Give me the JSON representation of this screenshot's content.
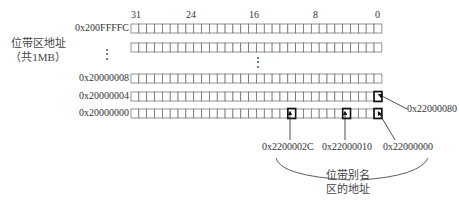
{
  "bit_labels": {
    "b31": "31",
    "b24": "24",
    "b16": "16",
    "b8": "8",
    "b0": "0"
  },
  "region_label": {
    "line1": "位带区地址",
    "line2": "（共1MB）"
  },
  "rows": [
    {
      "address": "0x200FFFFC"
    },
    {
      "address": ""
    },
    {
      "address": "0x20000008"
    },
    {
      "address": "0x20000004"
    },
    {
      "address": "0x20000000"
    }
  ],
  "ellipsis": "⋮",
  "aliases": {
    "a_2c": "0x2200002C",
    "a_10": "0x22000010",
    "a_00": "0x22000000",
    "a_80": "0x22000080"
  },
  "alias_region_label": {
    "line1": "位带别名",
    "line2": "区的地址"
  },
  "colors": {
    "grid": "#666666",
    "highlight": "#111111"
  }
}
